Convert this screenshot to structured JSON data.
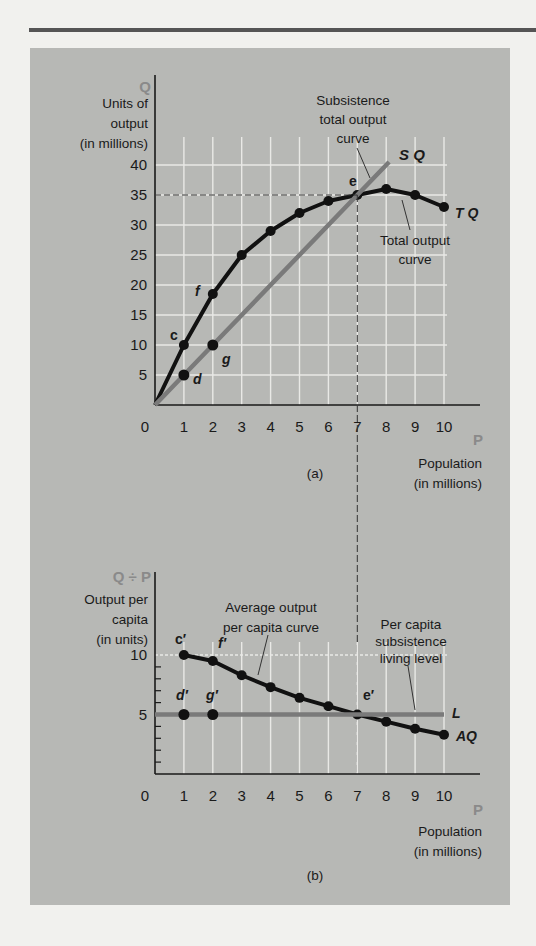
{
  "rule_color": "#555555",
  "panel_color": "#b7b8b5",
  "chart_data": [
    {
      "id": "a",
      "type": "line",
      "caption": "(a)",
      "y_axis_symbol": "Q",
      "ylabel_lines": [
        "Units of",
        "output",
        "(in millions)"
      ],
      "x_axis_symbol": "P",
      "xlabel_lines": [
        "Population",
        "(in millions)"
      ],
      "x_ticks": [
        0,
        1,
        2,
        3,
        4,
        5,
        6,
        7,
        8,
        9,
        10
      ],
      "y_ticks": [
        5,
        10,
        15,
        20,
        25,
        30,
        35,
        40
      ],
      "xlim": [
        0,
        11
      ],
      "ylim": [
        0,
        45
      ],
      "grid": true,
      "series": [
        {
          "name": "TQ",
          "label": "Total output curve",
          "color": "#111111",
          "x": [
            0,
            1,
            2,
            3,
            4,
            5,
            6,
            7,
            8,
            9,
            10
          ],
          "y": [
            0,
            10,
            18.5,
            25,
            29,
            32,
            34,
            35,
            36,
            35,
            33
          ]
        },
        {
          "name": "SQ",
          "label": "Subsistence total output curve",
          "color": "#7a7a7a",
          "x": [
            0,
            1,
            2,
            7,
            8.1
          ],
          "y": [
            0,
            5,
            10,
            35,
            40.5
          ]
        }
      ],
      "point_labels": [
        {
          "text": "c",
          "x": 1,
          "y": 10
        },
        {
          "text": "f",
          "x": 2,
          "y": 18.5
        },
        {
          "text": "d",
          "x": 1,
          "y": 5
        },
        {
          "text": "g",
          "x": 2,
          "y": 10
        },
        {
          "text": "e",
          "x": 7,
          "y": 35
        }
      ],
      "annotations": [
        {
          "text": [
            "Subsistence",
            "total output",
            "curve"
          ],
          "points_to": "SQ"
        },
        {
          "text": [
            "Total output",
            "curve"
          ],
          "points_to": "TQ"
        }
      ],
      "reference_lines": {
        "horizontal_dashed_y": 35,
        "vertical_dashed_x": 7
      }
    },
    {
      "id": "b",
      "type": "line",
      "caption": "(b)",
      "y_axis_symbol": "Q ÷ P",
      "ylabel_lines": [
        "Output per",
        "capita",
        "(in units)"
      ],
      "x_axis_symbol": "P",
      "xlabel_lines": [
        "Population",
        "(in millions)"
      ],
      "x_ticks": [
        0,
        1,
        2,
        3,
        4,
        5,
        6,
        7,
        8,
        9,
        10
      ],
      "y_ticks": [
        5,
        10
      ],
      "xlim": [
        0,
        11
      ],
      "ylim": [
        0,
        11
      ],
      "grid": true,
      "series": [
        {
          "name": "AQ",
          "label": "Average output per capita curve",
          "color": "#111111",
          "x": [
            1,
            2,
            3,
            4,
            5,
            6,
            7,
            8,
            9,
            10
          ],
          "y": [
            10,
            9.5,
            8.3,
            7.3,
            6.4,
            5.7,
            5,
            4.4,
            3.8,
            3.3
          ]
        },
        {
          "name": "L",
          "label": "Per capita subsistence living level",
          "color": "#7a7a7a",
          "x": [
            0,
            10
          ],
          "y": [
            5,
            5
          ]
        }
      ],
      "extra_points": [
        {
          "x": 1,
          "y": 5
        },
        {
          "x": 2,
          "y": 5
        }
      ],
      "point_labels": [
        {
          "text": "c′",
          "x": 1,
          "y": 10
        },
        {
          "text": "f′",
          "x": 2,
          "y": 9.5
        },
        {
          "text": "d′",
          "x": 1,
          "y": 5
        },
        {
          "text": "g′",
          "x": 2,
          "y": 5
        },
        {
          "text": "e′",
          "x": 7,
          "y": 5
        }
      ],
      "annotations": [
        {
          "text": [
            "Average output",
            "per capita curve"
          ],
          "points_to": "AQ"
        },
        {
          "text": [
            "Per capita",
            "subsistence",
            "living level"
          ],
          "points_to": "L"
        }
      ]
    }
  ]
}
